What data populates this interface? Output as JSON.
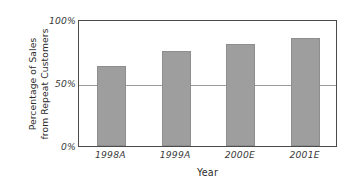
{
  "chart_data": {
    "type": "bar",
    "title": "",
    "subtitle": "",
    "xlabel": "Year",
    "ylabel_lines": [
      "Percentage of Sales",
      "from Repeat Customers"
    ],
    "ylabel": "Percentage of Sales from Repeat Customers",
    "categories": [
      "1998A",
      "1999A",
      "2000E",
      "2001E"
    ],
    "values": [
      63,
      75,
      80,
      85
    ],
    "ylim": [
      0,
      100
    ],
    "yticks": [
      0,
      50,
      100
    ],
    "ytick_labels": [
      "0%",
      "50%",
      "100%"
    ],
    "grid": "horizontal-at-50-only",
    "legend": "none",
    "bar_color": "#9e9e9e",
    "bar_edge_color": "#8e8e8e",
    "axis_color": "#4a4a4a",
    "gridline_color": "#9a9a9a",
    "background_color": "#ffffff",
    "annotations": []
  },
  "axes": {
    "y_ticks": [
      {
        "label": "100%",
        "value": 100
      },
      {
        "label": "50%",
        "value": 50
      },
      {
        "label": "0%",
        "value": 0
      }
    ],
    "x_ticks": [
      {
        "label": "1998A",
        "value": 63
      },
      {
        "label": "1999A",
        "value": 75
      },
      {
        "label": "2000E",
        "value": 80
      },
      {
        "label": "2001E",
        "value": 85
      }
    ]
  }
}
